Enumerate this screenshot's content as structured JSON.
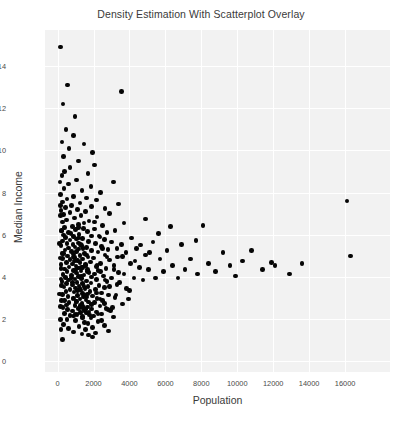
{
  "chart_data": {
    "type": "scatter",
    "title": "Density Estimation With Scatterplot Overlay",
    "xlabel": "Population",
    "ylabel": "Median Income",
    "xlim": [
      -700,
      18500
    ],
    "ylim": [
      -0.5,
      15.7
    ],
    "xticks": [
      0,
      2000,
      4000,
      6000,
      8000,
      10000,
      12000,
      14000,
      16000
    ],
    "xticklabels": [
      "0",
      "2000",
      "4000",
      "6000",
      "8000",
      "10000",
      "12000",
      "14000",
      "16000"
    ],
    "yticks": [
      0,
      2,
      4,
      6,
      8,
      10,
      12,
      14
    ],
    "yticklabels": [
      "0",
      "2",
      "4",
      "6",
      "8",
      "10",
      "12",
      "14"
    ],
    "grid": true,
    "grid_color": "#ffffff",
    "plot_background": "#f2f2f2",
    "figure_background": "#ffffff",
    "marker_color": "#050505",
    "marker_size": 4.6,
    "legend": null,
    "n_points": 398,
    "points": [
      [
        170,
        14.9
      ],
      [
        560,
        13.1
      ],
      [
        3550,
        12.8
      ],
      [
        300,
        12.2
      ],
      [
        980,
        11.6
      ],
      [
        460,
        11.0
      ],
      [
        900,
        10.7
      ],
      [
        250,
        10.4
      ],
      [
        1460,
        10.3
      ],
      [
        640,
        10.1
      ],
      [
        1950,
        9.9
      ],
      [
        330,
        9.7
      ],
      [
        1150,
        9.5
      ],
      [
        2050,
        9.3
      ],
      [
        700,
        9.2
      ],
      [
        400,
        9.0
      ],
      [
        1700,
        8.9
      ],
      [
        240,
        8.8
      ],
      [
        1050,
        8.6
      ],
      [
        3100,
        8.5
      ],
      [
        620,
        8.4
      ],
      [
        1850,
        8.3
      ],
      [
        360,
        8.2
      ],
      [
        1350,
        8.1
      ],
      [
        2400,
        8.0
      ],
      [
        150,
        7.9
      ],
      [
        880,
        7.8
      ],
      [
        1600,
        7.75
      ],
      [
        520,
        7.7
      ],
      [
        2150,
        7.65
      ],
      [
        16100,
        7.6
      ],
      [
        290,
        7.55
      ],
      [
        1250,
        7.5
      ],
      [
        3400,
        7.45
      ],
      [
        760,
        7.4
      ],
      [
        1900,
        7.35
      ],
      [
        430,
        7.3
      ],
      [
        2650,
        7.25
      ],
      [
        1100,
        7.2
      ],
      [
        180,
        7.15
      ],
      [
        1550,
        7.1
      ],
      [
        680,
        7.05
      ],
      [
        2900,
        7.0
      ],
      [
        340,
        6.95
      ],
      [
        1300,
        6.9
      ],
      [
        2200,
        6.85
      ],
      [
        940,
        6.8
      ],
      [
        4900,
        6.75
      ],
      [
        500,
        6.7
      ],
      [
        1750,
        6.65
      ],
      [
        260,
        6.6
      ],
      [
        3700,
        6.55
      ],
      [
        1150,
        6.5
      ],
      [
        2500,
        6.45
      ],
      [
        820,
        6.4
      ],
      [
        6300,
        6.38
      ],
      [
        390,
        6.35
      ],
      [
        1450,
        6.3
      ],
      [
        2050,
        6.28
      ],
      [
        1000,
        6.25
      ],
      [
        3200,
        6.2
      ],
      [
        220,
        6.18
      ],
      [
        1650,
        6.15
      ],
      [
        600,
        6.12
      ],
      [
        2750,
        6.1
      ],
      [
        5600,
        6.05
      ],
      [
        1200,
        6.0
      ],
      [
        330,
        5.98
      ],
      [
        1880,
        5.95
      ],
      [
        900,
        5.92
      ],
      [
        2350,
        5.9
      ],
      [
        450,
        5.88
      ],
      [
        4100,
        5.85
      ],
      [
        1400,
        5.82
      ],
      [
        1050,
        5.8
      ],
      [
        2600,
        5.78
      ],
      [
        700,
        5.75
      ],
      [
        7700,
        5.72
      ],
      [
        280,
        5.7
      ],
      [
        1720,
        5.68
      ],
      [
        3000,
        5.65
      ],
      [
        1150,
        5.62
      ],
      [
        520,
        5.6
      ],
      [
        2100,
        5.58
      ],
      [
        860,
        5.55
      ],
      [
        4600,
        5.52
      ],
      [
        1330,
        5.5
      ],
      [
        200,
        5.48
      ],
      [
        2450,
        5.45
      ],
      [
        980,
        5.42
      ],
      [
        1600,
        5.4
      ],
      [
        620,
        5.38
      ],
      [
        3300,
        5.35
      ],
      [
        1180,
        5.32
      ],
      [
        2800,
        5.3
      ],
      [
        420,
        5.28
      ],
      [
        1900,
        5.25
      ],
      [
        760,
        5.22
      ],
      [
        1050,
        5.2
      ],
      [
        2250,
        5.18
      ],
      [
        5100,
        5.15
      ],
      [
        330,
        5.12
      ],
      [
        1500,
        5.1
      ],
      [
        890,
        5.08
      ],
      [
        2650,
        5.05
      ],
      [
        1250,
        5.02
      ],
      [
        560,
        5.0
      ],
      [
        3600,
        4.98
      ],
      [
        1700,
        4.95
      ],
      [
        950,
        4.92
      ],
      [
        2000,
        4.9
      ],
      [
        260,
        4.88
      ],
      [
        1380,
        4.85
      ],
      [
        700,
        4.82
      ],
      [
        2900,
        4.8
      ],
      [
        1100,
        4.78
      ],
      [
        4300,
        4.75
      ],
      [
        1820,
        4.72
      ],
      [
        480,
        4.7
      ],
      [
        1250,
        4.68
      ],
      [
        2400,
        4.65
      ],
      [
        840,
        4.62
      ],
      [
        1550,
        4.6
      ],
      [
        180,
        4.58
      ],
      [
        3150,
        4.55
      ],
      [
        1020,
        4.52
      ],
      [
        2150,
        4.5
      ],
      [
        640,
        4.48
      ],
      [
        1400,
        4.45
      ],
      [
        11900,
        4.68
      ],
      [
        1180,
        4.42
      ],
      [
        2700,
        4.4
      ],
      [
        380,
        4.38
      ],
      [
        1650,
        4.35
      ],
      [
        900,
        4.32
      ],
      [
        2250,
        4.3
      ],
      [
        1300,
        4.28
      ],
      [
        520,
        4.25
      ],
      [
        3400,
        4.22
      ],
      [
        1750,
        4.2
      ],
      [
        1050,
        4.18
      ],
      [
        2050,
        4.15
      ],
      [
        300,
        4.12
      ],
      [
        1480,
        4.1
      ],
      [
        780,
        4.08
      ],
      [
        2550,
        4.05
      ],
      [
        1150,
        4.02
      ],
      [
        1900,
        4.0
      ],
      [
        430,
        3.98
      ],
      [
        3000,
        3.95
      ],
      [
        1320,
        3.92
      ],
      [
        960,
        3.9
      ],
      [
        2180,
        3.88
      ],
      [
        620,
        3.85
      ],
      [
        1600,
        3.82
      ],
      [
        240,
        3.8
      ],
      [
        2750,
        3.78
      ],
      [
        1080,
        3.75
      ],
      [
        1850,
        3.72
      ],
      [
        500,
        3.7
      ],
      [
        1400,
        3.68
      ],
      [
        3300,
        3.65
      ],
      [
        840,
        3.62
      ],
      [
        2300,
        3.6
      ],
      [
        1200,
        3.58
      ],
      [
        1700,
        3.55
      ],
      [
        350,
        3.52
      ],
      [
        2600,
        3.5
      ],
      [
        1000,
        3.48
      ],
      [
        1520,
        3.45
      ],
      [
        690,
        3.42
      ],
      [
        2100,
        3.4
      ],
      [
        1280,
        3.38
      ],
      [
        4000,
        3.35
      ],
      [
        1800,
        3.32
      ],
      [
        460,
        3.3
      ],
      [
        920,
        3.28
      ],
      [
        2450,
        3.25
      ],
      [
        1380,
        3.22
      ],
      [
        1650,
        3.2
      ],
      [
        280,
        3.18
      ],
      [
        2850,
        3.15
      ],
      [
        1120,
        3.12
      ],
      [
        1950,
        3.1
      ],
      [
        580,
        3.08
      ],
      [
        1450,
        3.05
      ],
      [
        3200,
        3.02
      ],
      [
        870,
        3.0
      ],
      [
        2200,
        2.98
      ],
      [
        1250,
        2.95
      ],
      [
        1580,
        2.92
      ],
      [
        380,
        2.9
      ],
      [
        2500,
        2.88
      ],
      [
        1020,
        2.85
      ],
      [
        1720,
        2.82
      ],
      [
        640,
        2.8
      ],
      [
        2050,
        2.78
      ],
      [
        1350,
        2.75
      ],
      [
        3600,
        2.72
      ],
      [
        1880,
        2.7
      ],
      [
        480,
        2.68
      ],
      [
        960,
        2.65
      ],
      [
        2350,
        2.62
      ],
      [
        1420,
        2.6
      ],
      [
        1650,
        2.58
      ],
      [
        300,
        2.55
      ],
      [
        2700,
        2.52
      ],
      [
        1150,
        2.5
      ],
      [
        1900,
        2.48
      ],
      [
        560,
        2.45
      ],
      [
        1500,
        2.42
      ],
      [
        2950,
        2.4
      ],
      [
        820,
        2.38
      ],
      [
        2150,
        2.35
      ],
      [
        1280,
        2.32
      ],
      [
        1620,
        2.3
      ],
      [
        400,
        2.28
      ],
      [
        2450,
        2.25
      ],
      [
        1080,
        2.22
      ],
      [
        1780,
        2.2
      ],
      [
        700,
        2.18
      ],
      [
        2000,
        2.15
      ],
      [
        1400,
        2.12
      ],
      [
        3100,
        2.1
      ],
      [
        1850,
        2.05
      ],
      [
        520,
        2.0
      ],
      [
        1000,
        1.95
      ],
      [
        2250,
        1.9
      ],
      [
        1500,
        1.85
      ],
      [
        1700,
        1.8
      ],
      [
        340,
        1.75
      ],
      [
        2600,
        1.7
      ],
      [
        1200,
        1.65
      ],
      [
        1950,
        1.6
      ],
      [
        620,
        1.55
      ],
      [
        1550,
        1.5
      ],
      [
        2850,
        1.45
      ],
      [
        900,
        1.4
      ],
      [
        2100,
        1.35
      ],
      [
        1350,
        1.3
      ],
      [
        1720,
        1.25
      ],
      [
        1950,
        1.15
      ],
      [
        260,
        1.05
      ],
      [
        1180,
        5.85
      ],
      [
        1420,
        5.35
      ],
      [
        880,
        4.95
      ],
      [
        1560,
        4.55
      ],
      [
        1020,
        4.35
      ],
      [
        1340,
        4.05
      ],
      [
        780,
        3.95
      ],
      [
        1460,
        3.55
      ],
      [
        1100,
        3.35
      ],
      [
        1620,
        3.05
      ],
      [
        860,
        2.95
      ],
      [
        1280,
        2.65
      ],
      [
        1540,
        2.45
      ],
      [
        980,
        2.25
      ],
      [
        1380,
        2.05
      ],
      [
        1180,
        6.35
      ],
      [
        1480,
        6.55
      ],
      [
        740,
        6.05
      ],
      [
        1260,
        5.55
      ],
      [
        1600,
        5.05
      ],
      [
        940,
        4.75
      ],
      [
        1320,
        4.45
      ],
      [
        1680,
        4.25
      ],
      [
        820,
        3.75
      ],
      [
        1240,
        3.45
      ],
      [
        1500,
        3.15
      ],
      [
        1060,
        2.85
      ],
      [
        1400,
        2.55
      ],
      [
        1740,
        2.35
      ],
      [
        900,
        2.15
      ],
      [
        2050,
        6.6
      ],
      [
        2300,
        5.95
      ],
      [
        2500,
        5.35
      ],
      [
        2750,
        4.95
      ],
      [
        2200,
        4.55
      ],
      [
        2400,
        4.25
      ],
      [
        2650,
        3.85
      ],
      [
        2900,
        3.55
      ],
      [
        2150,
        3.25
      ],
      [
        2350,
        2.95
      ],
      [
        2600,
        2.75
      ],
      [
        2800,
        2.45
      ],
      [
        2250,
        2.25
      ],
      [
        2450,
        1.95
      ],
      [
        3050,
        2.55
      ],
      [
        3250,
        3.15
      ],
      [
        3450,
        3.75
      ],
      [
        3150,
        4.35
      ],
      [
        3350,
        4.95
      ],
      [
        3550,
        5.55
      ],
      [
        3700,
        4.15
      ],
      [
        3850,
        3.45
      ],
      [
        3950,
        2.95
      ],
      [
        3800,
        5.15
      ],
      [
        4050,
        4.65
      ],
      [
        4250,
        3.95
      ],
      [
        4400,
        5.35
      ],
      [
        4550,
        4.45
      ],
      [
        4750,
        3.85
      ],
      [
        4900,
        5.05
      ],
      [
        5050,
        4.35
      ],
      [
        5300,
        5.65
      ],
      [
        5450,
        3.95
      ],
      [
        5700,
        4.85
      ],
      [
        5900,
        4.25
      ],
      [
        6100,
        5.25
      ],
      [
        6400,
        4.55
      ],
      [
        6700,
        3.95
      ],
      [
        6900,
        5.55
      ],
      [
        7100,
        4.35
      ],
      [
        7400,
        4.85
      ],
      [
        7800,
        4.15
      ],
      [
        8100,
        6.45
      ],
      [
        8400,
        4.65
      ],
      [
        8800,
        4.25
      ],
      [
        9200,
        5.15
      ],
      [
        9600,
        4.55
      ],
      [
        9900,
        4.05
      ],
      [
        10300,
        4.75
      ],
      [
        10800,
        5.25
      ],
      [
        11400,
        4.35
      ],
      [
        12100,
        4.55
      ],
      [
        12900,
        4.15
      ],
      [
        13600,
        4.65
      ],
      [
        16300,
        5.0
      ],
      [
        150,
        6.9
      ],
      [
        120,
        5.6
      ],
      [
        190,
        4.4
      ],
      [
        210,
        3.6
      ],
      [
        160,
        2.6
      ],
      [
        130,
        8.5
      ],
      [
        175,
        7.4
      ],
      [
        205,
        6.2
      ],
      [
        140,
        4.9
      ],
      [
        185,
        3.9
      ],
      [
        225,
        2.9
      ],
      [
        155,
        2.0
      ],
      [
        195,
        1.5
      ],
      [
        110,
        3.2
      ],
      [
        235,
        5.1
      ]
    ]
  }
}
